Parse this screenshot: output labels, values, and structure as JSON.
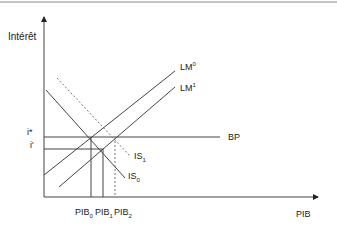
{
  "diagram": {
    "type": "IS-LM-BP",
    "y_axis_label": "Intérêt",
    "x_axis_label": "PIB",
    "curves": [
      {
        "name": "LM0",
        "label_base": "LM",
        "label_sup": "0",
        "style": "solid"
      },
      {
        "name": "LM1",
        "label_base": "LM",
        "label_sup": "1",
        "style": "solid"
      },
      {
        "name": "IS0",
        "label_base": "IS",
        "label_sub": "0",
        "style": "solid"
      },
      {
        "name": "IS1",
        "label_base": "IS",
        "label_sub": "1",
        "style": "dashed"
      },
      {
        "name": "BP",
        "label_base": "BP",
        "style": "solid"
      }
    ],
    "y_ticks": [
      {
        "label": "i*"
      },
      {
        "label": "i'"
      }
    ],
    "x_ticks": [
      {
        "base": "PIB",
        "sub": "0",
        "style": "solid"
      },
      {
        "base": "PIB",
        "sub": "1",
        "style": "solid"
      },
      {
        "base": "PIB",
        "sub": "2",
        "style": "dashed"
      }
    ],
    "colors": {
      "line": "#444444",
      "dashed": "#777777",
      "text": "#222222"
    }
  }
}
